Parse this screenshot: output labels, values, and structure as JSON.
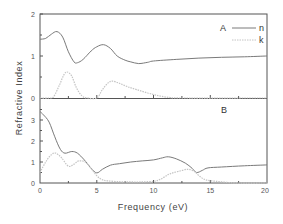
{
  "chart_data": {
    "type": "line",
    "xlabel": "Frequency (eV)",
    "ylabel": "Refractive Index",
    "xlim": [
      0,
      20
    ],
    "x_ticks": [
      "0",
      "5",
      "10",
      "15",
      "20"
    ],
    "grid": false,
    "legend": {
      "position": "upper right of panel A",
      "entries": [
        "n",
        "k"
      ]
    },
    "colors": {
      "n": "#7a7a7a",
      "k": "#c4c4c4",
      "frame": "#555555"
    },
    "panels": [
      {
        "label": "A",
        "ylim": [
          0,
          2
        ],
        "y_ticks": [
          "0",
          "1",
          "2"
        ],
        "series": [
          {
            "name": "n",
            "style": "solid",
            "x": [
              0,
              0.5,
              1.0,
              1.5,
              2.0,
              2.5,
              3.0,
              3.3,
              3.8,
              4.5,
              5.0,
              5.6,
              6.2,
              6.8,
              7.5,
              8.0,
              8.7,
              9.5,
              10,
              12,
              14,
              16,
              18,
              20
            ],
            "y": [
              1.4,
              1.42,
              1.52,
              1.58,
              1.45,
              1.1,
              0.86,
              0.84,
              0.92,
              1.12,
              1.22,
              1.27,
              1.18,
              1.0,
              0.9,
              0.86,
              0.82,
              0.85,
              0.88,
              0.92,
              0.95,
              0.97,
              0.98,
              1.0
            ]
          },
          {
            "name": "k",
            "style": "dotted",
            "x": [
              0,
              0.8,
              1.2,
              1.7,
              2.1,
              2.4,
              2.8,
              3.2,
              3.7,
              4.2,
              5.0,
              5.5,
              6.0,
              6.4,
              7.0,
              7.7,
              8.5,
              9.5,
              10.5,
              11.5,
              12.5,
              20
            ],
            "y": [
              0,
              0,
              0.03,
              0.3,
              0.55,
              0.62,
              0.52,
              0.25,
              0.05,
              0,
              0,
              0.2,
              0.36,
              0.4,
              0.35,
              0.27,
              0.2,
              0.12,
              0.05,
              0.01,
              0,
              0
            ]
          }
        ]
      },
      {
        "label": "B",
        "ylim": [
          0,
          4
        ],
        "y_ticks": [
          "0",
          "1",
          "2",
          "3"
        ],
        "series": [
          {
            "name": "n",
            "style": "solid",
            "x": [
              0,
              0.3,
              0.8,
              1.3,
              1.8,
              2.2,
              2.8,
              3.3,
              3.9,
              4.5,
              5.0,
              5.5,
              6.2,
              7.0,
              8.0,
              9.0,
              10.0,
              10.8,
              11.3,
              12.0,
              12.8,
              13.4,
              13.8,
              14.3,
              14.8,
              16.0,
              18.0,
              20.0
            ],
            "y": [
              3.4,
              3.25,
              2.9,
              2.2,
              1.6,
              1.42,
              1.5,
              1.42,
              1.1,
              0.7,
              0.48,
              0.65,
              0.85,
              0.92,
              1.0,
              1.05,
              1.1,
              1.2,
              1.25,
              1.15,
              0.95,
              0.7,
              0.5,
              0.6,
              0.72,
              0.76,
              0.82,
              0.86
            ]
          },
          {
            "name": "k",
            "style": "dotted",
            "x": [
              0,
              0.5,
              1.0,
              1.4,
              1.9,
              2.5,
              3.0,
              3.4,
              4.0,
              4.5,
              5.0,
              5.5,
              6.0,
              7.0,
              8.0,
              9.0,
              10.0,
              10.5,
              11.0,
              11.5,
              12.2,
              13.0,
              13.6,
              14.0,
              14.6,
              15.5,
              16.5,
              17.5,
              20.0
            ],
            "y": [
              0.5,
              1.0,
              1.35,
              1.42,
              1.2,
              0.8,
              0.9,
              1.05,
              1.0,
              0.7,
              0.35,
              0.15,
              0.1,
              0.06,
              0.05,
              0.05,
              0.08,
              0.15,
              0.3,
              0.45,
              0.55,
              0.65,
              0.55,
              0.35,
              0.15,
              0.08,
              0.03,
              0,
              0
            ]
          }
        ]
      }
    ]
  },
  "labels": {
    "xlabel": "Frequency (eV)",
    "ylabel": "Refractive Index",
    "panel_a": "A",
    "panel_b": "B",
    "legend_n": "n",
    "legend_k": "k",
    "x_tick_0": "0",
    "x_tick_5": "5",
    "x_tick_10": "10",
    "x_tick_15": "15",
    "x_tick_20": "20",
    "a_tick_0": "0",
    "a_tick_1": "1",
    "a_tick_2": "2",
    "b_tick_0": "0",
    "b_tick_1": "1",
    "b_tick_2": "2",
    "b_tick_3": "3"
  }
}
